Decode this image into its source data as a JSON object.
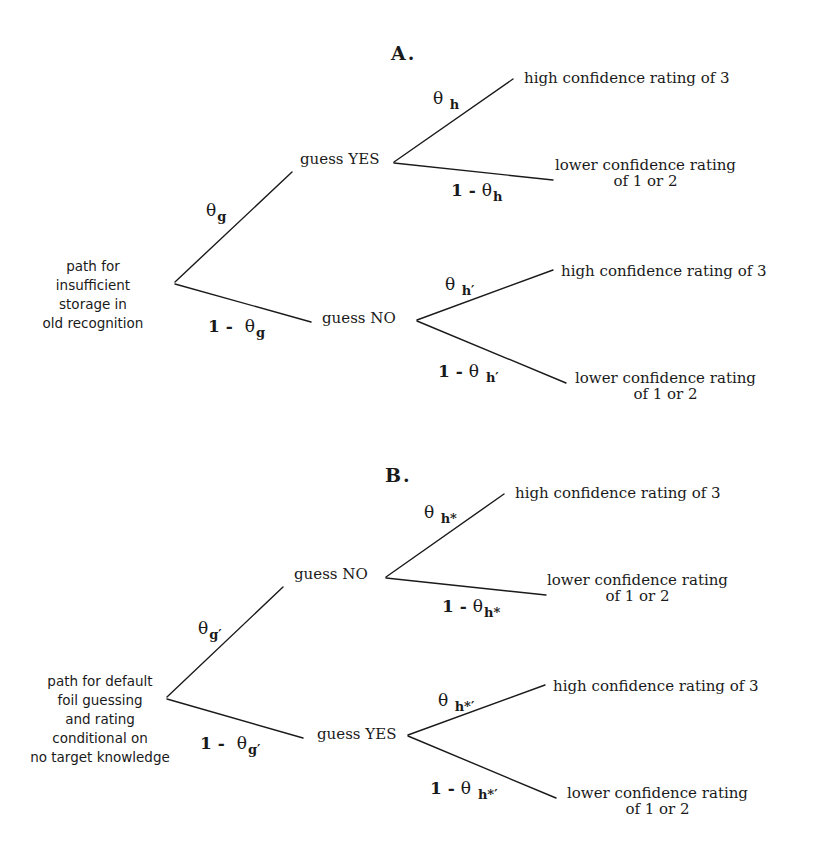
{
  "figure": {
    "panels": [
      {
        "id": "A",
        "title": "A.",
        "root_label_lines": [
          "path for",
          "insufficient",
          "storage in",
          "old recognition"
        ],
        "branch_upper": {
          "prob_prefix": "",
          "symbol": "θ",
          "subscript": "g",
          "node_label": "guess YES",
          "leaves": {
            "upper": {
              "prob_prefix": "",
              "symbol": "θ",
              "subscript": "h",
              "label_lines": [
                "high confidence rating of 3"
              ]
            },
            "lower": {
              "prob_prefix": "1 - ",
              "symbol": "θ",
              "subscript": "h",
              "label_lines": [
                "lower confidence rating",
                "of 1 or 2"
              ]
            }
          }
        },
        "branch_lower": {
          "prob_prefix": "1 - ",
          "symbol": "θ",
          "subscript": "g",
          "node_label": "guess NO",
          "leaves": {
            "upper": {
              "prob_prefix": "",
              "symbol": "θ",
              "subscript": "h′",
              "label_lines": [
                "high confidence rating of 3"
              ]
            },
            "lower": {
              "prob_prefix": "1 - ",
              "symbol": "θ",
              "subscript": "h′",
              "label_lines": [
                "lower confidence rating",
                "of 1 or 2"
              ]
            }
          }
        }
      },
      {
        "id": "B",
        "title": "B.",
        "root_label_lines": [
          "path for default",
          "foil guessing",
          "and rating",
          "conditional on",
          "no target knowledge"
        ],
        "branch_upper": {
          "prob_prefix": "",
          "symbol": "θ",
          "subscript": "g′",
          "node_label": "guess NO",
          "leaves": {
            "upper": {
              "prob_prefix": "",
              "symbol": "θ",
              "subscript": "h*",
              "label_lines": [
                "high confidence rating of 3"
              ]
            },
            "lower": {
              "prob_prefix": "1 - ",
              "symbol": "θ",
              "subscript": "h*",
              "label_lines": [
                "lower confidence rating",
                "of 1 or 2"
              ]
            }
          }
        },
        "branch_lower": {
          "prob_prefix": "1 - ",
          "symbol": "θ",
          "subscript": "g′",
          "node_label": "guess YES",
          "leaves": {
            "upper": {
              "prob_prefix": "",
              "symbol": "θ",
              "subscript": "h*′",
              "label_lines": [
                "high confidence rating of 3"
              ]
            },
            "lower": {
              "prob_prefix": "1 - ",
              "symbol": "θ",
              "subscript": "h*′",
              "label_lines": [
                "lower confidence rating",
                "of 1 or 2"
              ]
            }
          }
        }
      }
    ],
    "line_color": "#1a1a1a",
    "background": "#ffffff"
  }
}
